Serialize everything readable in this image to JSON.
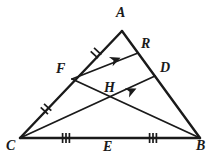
{
  "figure": {
    "type": "geometry-diagram",
    "background_color": "#ffffff",
    "stroke_color": "#1a1a1a"
  },
  "points": {
    "A": {
      "label": "A",
      "x": 122,
      "y": 31,
      "label_x": 116,
      "label_y": 6
    },
    "B": {
      "label": "B",
      "x": 200,
      "y": 138,
      "label_x": 196,
      "label_y": 139
    },
    "C": {
      "label": "C",
      "x": 20,
      "y": 138,
      "label_x": 8,
      "label_y": 139
    },
    "F": {
      "label": "F",
      "x": 72,
      "y": 79,
      "label_x": 56,
      "label_y": 62
    },
    "D": {
      "label": "D",
      "x": 155,
      "y": 76,
      "label_x": 160,
      "label_y": 61
    },
    "R": {
      "label": "R",
      "x": 138,
      "y": 53,
      "label_x": 141,
      "label_y": 37
    },
    "E": {
      "label": "E",
      "x": 110,
      "y": 138,
      "label_x": 103,
      "label_y": 140
    },
    "H": {
      "label": "H",
      "x": 113,
      "y": 101,
      "label_x": 104,
      "label_y": 81
    }
  },
  "segments": [
    {
      "name": "side-CA",
      "from": "C",
      "to": "A",
      "width": 2.4
    },
    {
      "name": "side-AB",
      "from": "A",
      "to": "B",
      "width": 2.4
    },
    {
      "name": "side-CB",
      "from": "C",
      "to": "B",
      "width": 2.4
    },
    {
      "name": "segment-FR",
      "from": "F",
      "to": "R",
      "width": 1.8
    },
    {
      "name": "segment-FB",
      "from": "F",
      "to": "B",
      "width": 1.8
    },
    {
      "name": "segment-CD",
      "from": "C",
      "to": "D",
      "width": 1.8
    }
  ],
  "tick_marks": [
    {
      "name": "tick-AF",
      "on": "segment-AF",
      "count": 2,
      "x": 96,
      "y": 53
    },
    {
      "name": "tick-CF",
      "on": "segment-CF",
      "count": 2,
      "x": 46,
      "y": 109
    },
    {
      "name": "tick-CE",
      "on": "segment-CE",
      "count": 3,
      "x": 66,
      "y": 138
    },
    {
      "name": "tick-EB",
      "on": "segment-EB",
      "count": 3,
      "x": 153,
      "y": 138
    }
  ],
  "arrow_marks": [
    {
      "name": "arrow-FR",
      "on": "segment-FR",
      "x": 115,
      "y": 60,
      "angle": -23
    },
    {
      "name": "arrow-CD",
      "on": "segment-CD",
      "x": 131,
      "y": 91,
      "angle": -23
    }
  ]
}
